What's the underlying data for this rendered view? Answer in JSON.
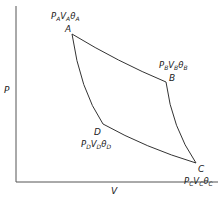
{
  "diagram": {
    "type": "PV cycle diagram",
    "axes": {
      "y_label": "P",
      "x_label": "V"
    },
    "points": [
      {
        "id": "A",
        "label": "A",
        "state": {
          "P": "P",
          "P_sub": "A",
          "V": "V",
          "V_sub": "A",
          "T": "θ",
          "T_sub": "A"
        }
      },
      {
        "id": "B",
        "label": "B",
        "state": {
          "P": "P",
          "P_sub": "B",
          "V": "V",
          "V_sub": "B",
          "T": "θ",
          "T_sub": "B"
        }
      },
      {
        "id": "C",
        "label": "C",
        "state": {
          "P": "P",
          "P_sub": "C",
          "V": "V",
          "V_sub": "C",
          "T": "θ",
          "T_sub": "C"
        }
      },
      {
        "id": "D",
        "label": "D",
        "state": {
          "P": "P",
          "P_sub": "D",
          "V": "V",
          "V_sub": "D",
          "T": "θ",
          "T_sub": "D"
        }
      }
    ],
    "paths": [
      "A-B",
      "B-C",
      "C-D",
      "D-A"
    ],
    "colors": {
      "line": "#333333",
      "text": "#222222",
      "background": "#ffffff"
    }
  }
}
